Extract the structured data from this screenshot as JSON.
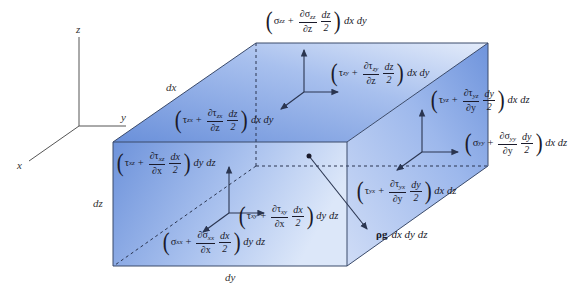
{
  "axes": {
    "x": "x",
    "y": "y",
    "z": "z"
  },
  "dimensions": {
    "dx": "dx",
    "dy": "dy",
    "dz": "dz"
  },
  "colors": {
    "face_light": "#eef3fc",
    "face_dark": "#6f94dc",
    "edge": "#3a4a6a",
    "arrow": "#2a3550"
  },
  "terms": {
    "szz": {
      "base": "σ",
      "sub": "zz",
      "dnum": "∂σ",
      "dsub": "zz",
      "dden": "∂z",
      "half_num": "dz",
      "half_den": "2",
      "tail": "dx dy"
    },
    "tzy": {
      "base": "τ",
      "sub": "zy",
      "dnum": "∂τ",
      "dsub": "zy",
      "dden": "∂z",
      "half_num": "dz",
      "half_den": "2",
      "tail": "dx dy"
    },
    "tzx": {
      "base": "τ",
      "sub": "zx",
      "dnum": "∂τ",
      "dsub": "zx",
      "dden": "∂z",
      "half_num": "dz",
      "half_den": "2",
      "tail": "dx dy"
    },
    "tyz": {
      "base": "τ",
      "sub": "yz",
      "dnum": "∂τ",
      "dsub": "yz",
      "dden": "∂y",
      "half_num": "dy",
      "half_den": "2",
      "tail": "dx dz"
    },
    "syy": {
      "base": "σ",
      "sub": "yy",
      "dnum": "∂σ",
      "dsub": "yy",
      "dden": "∂y",
      "half_num": "dy",
      "half_den": "2",
      "tail": "dx dz"
    },
    "tyx": {
      "base": "τ",
      "sub": "yx",
      "dnum": "∂τ",
      "dsub": "yx",
      "dden": "∂y",
      "half_num": "dy",
      "half_den": "2",
      "tail": "dx dz"
    },
    "txz": {
      "base": "τ",
      "sub": "xz",
      "dnum": "∂τ",
      "dsub": "xz",
      "dden": "∂x",
      "half_num": "dx",
      "half_den": "2",
      "tail": "dy dz"
    },
    "txy": {
      "base": "τ",
      "sub": "xy",
      "dnum": "∂τ",
      "dsub": "xy",
      "dden": "∂x",
      "half_num": "dx",
      "half_den": "2",
      "tail": "dy dz"
    },
    "sxx": {
      "base": "σ",
      "sub": "xx",
      "dnum": "∂σ",
      "dsub": "xx",
      "dden": "∂x",
      "half_num": "dx",
      "half_den": "2",
      "tail": "dy dz"
    }
  },
  "gravity": {
    "rho_g": "ρg",
    "tail": "dx dy dz"
  }
}
